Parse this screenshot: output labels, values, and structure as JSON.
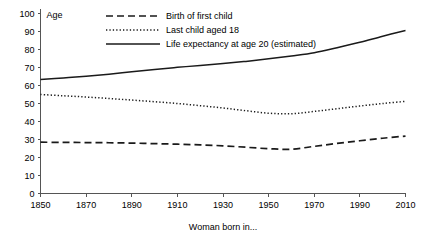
{
  "chart_data": {
    "type": "line",
    "title": "",
    "xlabel": "Woman born in...",
    "ylabel": "Age",
    "xlim": [
      1850,
      2010
    ],
    "ylim": [
      0,
      100
    ],
    "xticks": [
      1850,
      1870,
      1890,
      1910,
      1930,
      1950,
      1970,
      1990,
      2010
    ],
    "yticks": [
      0,
      10,
      20,
      30,
      40,
      50,
      60,
      70,
      80,
      90,
      100
    ],
    "grid": false,
    "legend_position": "top-center",
    "x": [
      1850,
      1860,
      1870,
      1880,
      1890,
      1900,
      1910,
      1920,
      1930,
      1940,
      1950,
      1960,
      1970,
      1980,
      1990,
      2000,
      2010
    ],
    "series": [
      {
        "name": "Birth of first child",
        "style": "dashed",
        "color": "#1a1a1a",
        "values": [
          28.5,
          28.4,
          28.3,
          28.2,
          28.0,
          27.7,
          27.4,
          27.0,
          26.5,
          25.7,
          24.9,
          24.6,
          26.2,
          27.8,
          29.3,
          30.7,
          31.9
        ]
      },
      {
        "name": "Last child aged 18",
        "style": "dotted",
        "color": "#1a1a1a",
        "values": [
          55.0,
          54.3,
          53.6,
          52.8,
          51.9,
          51.0,
          50.0,
          48.8,
          47.5,
          46.0,
          44.6,
          44.3,
          45.6,
          47.1,
          48.6,
          50.0,
          51.2
        ]
      },
      {
        "name": "Life expectancy at age 20 (estimated)",
        "style": "solid",
        "color": "#1a1a1a",
        "values": [
          63.4,
          64.2,
          65.2,
          66.3,
          67.6,
          68.9,
          70.1,
          71.1,
          72.2,
          73.4,
          74.8,
          76.4,
          78.2,
          81.0,
          84.0,
          87.4,
          90.6
        ]
      }
    ],
    "legend": [
      {
        "label": "Birth of first child",
        "style": "dashed"
      },
      {
        "label": "Last child aged 18",
        "style": "dotted"
      },
      {
        "label": "Life expectancy at age 20 (estimated)",
        "style": "solid"
      }
    ]
  }
}
